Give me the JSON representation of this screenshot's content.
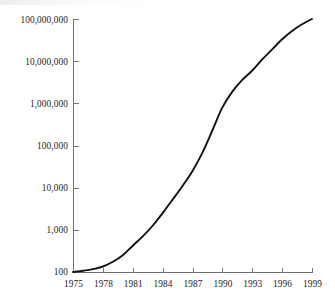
{
  "chart_data": {
    "type": "line",
    "title": "",
    "subtitle": "",
    "xlabel": "",
    "ylabel": "",
    "yscale": "log",
    "xscale": "linear",
    "grid": false,
    "legend": null,
    "legend_position": "none",
    "xlim": [
      1975,
      1999
    ],
    "ylim": [
      100,
      100000000
    ],
    "x_tick_labels": [
      "1975",
      "1978",
      "1981",
      "1984",
      "1987",
      "1990",
      "1993",
      "1996",
      "1999"
    ],
    "x_ticks": [
      1975,
      1978,
      1981,
      1984,
      1987,
      1990,
      1993,
      1996,
      1999
    ],
    "y_tick_labels": [
      "100,000,000",
      "10,000,000",
      "1,000,000",
      "100,000",
      "10,000",
      "1,000",
      "100"
    ],
    "y_ticks": [
      100000000,
      10000000,
      1000000,
      100000,
      10000,
      1000,
      100
    ],
    "series": [
      {
        "name": "growth-curve",
        "color": "#121212",
        "x": [
          1975,
          1976,
          1977,
          1978,
          1979,
          1980,
          1981,
          1982,
          1983,
          1984,
          1985,
          1986,
          1987,
          1988,
          1989,
          1990,
          1991,
          1992,
          1993,
          1994,
          1995,
          1996,
          1997,
          1998,
          1999
        ],
        "values": [
          100,
          107,
          117,
          135,
          175,
          250,
          420,
          700,
          1250,
          2500,
          5200,
          11000,
          25000,
          68000,
          230000,
          800000,
          1900000,
          3600000,
          6000000,
          11000000,
          19000000,
          33000000,
          52000000,
          75000000,
          100000000
        ]
      }
    ],
    "annotations": []
  },
  "colors": {
    "background": "#ffffff",
    "axis": "#6f6f72",
    "line": "#121212",
    "text": "#1d1d1d"
  },
  "axis_geometry": {
    "left": 73,
    "right": 312,
    "top": 19,
    "bottom": 272
  }
}
